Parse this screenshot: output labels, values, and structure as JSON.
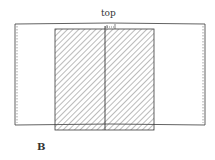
{
  "diagram": {
    "top_label": "top",
    "figure_label": "B",
    "colors": {
      "line": "#3a3a3a",
      "hatch": "#555555",
      "background": "#ffffff"
    }
  }
}
